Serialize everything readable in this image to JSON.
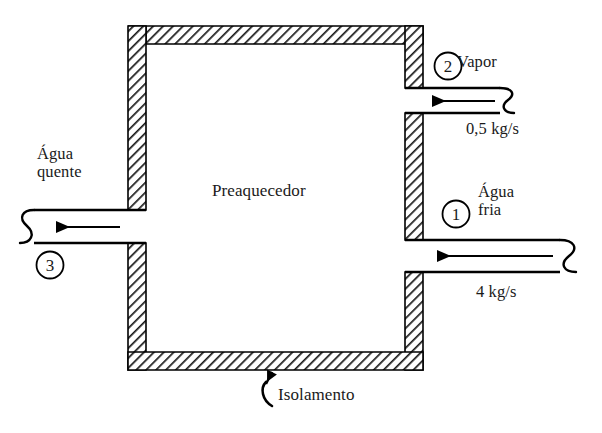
{
  "diagram": {
    "title": "Preaquecedor",
    "vessel": {
      "label": "Preaquecedor",
      "wall_note": "Isolamento",
      "wall_fill": "#ffffff",
      "wall_hatch_color": "#1a1a1a",
      "outline_color": "#000000"
    },
    "streams": [
      {
        "id": "1",
        "marker": "1",
        "name": "Água fria",
        "name_line1": "Água",
        "name_line2": "fria",
        "flow_rate": "4  kg/s",
        "direction": "inlet",
        "side": "right",
        "arrow": "left"
      },
      {
        "id": "2",
        "marker": "2",
        "name": "Vapor",
        "name_line1": "Vapor",
        "name_line2": "",
        "flow_rate": "0,5 kg/s",
        "direction": "inlet",
        "side": "right",
        "arrow": "left"
      },
      {
        "id": "3",
        "marker": "3",
        "name": "Água quente",
        "name_line1": "Água",
        "name_line2": "quente",
        "flow_rate": "",
        "direction": "outlet",
        "side": "left",
        "arrow": "left"
      }
    ],
    "annotations": {
      "insulation": "Isolamento"
    }
  }
}
